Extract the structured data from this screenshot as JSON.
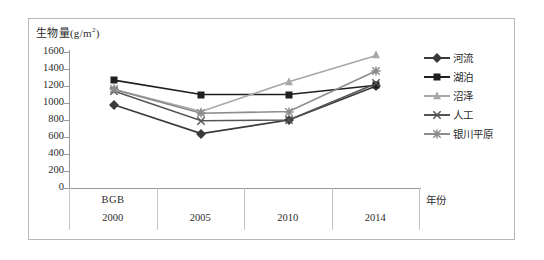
{
  "axes": {
    "y_label": "生物量(g/m",
    "y_label_sup": "2",
    "y_label_tail": ")",
    "x_title": "年份",
    "bgb_note": "BGB",
    "y_ticks": [
      "1600",
      "1400",
      "1200",
      "1000",
      "800",
      "600",
      "400",
      "200",
      "0"
    ]
  },
  "legend": {
    "items": [
      {
        "label": "河流",
        "marker": "diamond",
        "color": "#3a3a3a"
      },
      {
        "label": "湖泊",
        "marker": "square",
        "color": "#1f1f1f"
      },
      {
        "label": "沼泽",
        "marker": "triangle",
        "color": "#a8a8a8"
      },
      {
        "label": "人工",
        "marker": "cross",
        "color": "#555555"
      },
      {
        "label": "银川平原",
        "marker": "star",
        "color": "#8c8c8c"
      }
    ]
  },
  "chart_data": {
    "type": "line",
    "title": "",
    "xlabel": "年份",
    "ylabel": "生物量(g/m2)",
    "categories": [
      "2000",
      "2005",
      "2010",
      "2014"
    ],
    "ylim": [
      0,
      1600
    ],
    "ytick_step": 200,
    "grid": false,
    "legend_position": "right",
    "annotations": [
      "BGB"
    ],
    "series": [
      {
        "name": "河流",
        "marker": "diamond",
        "color": "#3a3a3a",
        "values": [
          980,
          640,
          800,
          1200
        ]
      },
      {
        "name": "湖泊",
        "marker": "square",
        "color": "#1f1f1f",
        "values": [
          1270,
          1100,
          1100,
          1210
        ]
      },
      {
        "name": "沼泽",
        "marker": "triangle",
        "color": "#a8a8a8",
        "values": [
          1160,
          900,
          1250,
          1560
        ]
      },
      {
        "name": "人工",
        "marker": "cross",
        "color": "#555555",
        "values": [
          1140,
          790,
          800,
          1230
        ]
      },
      {
        "name": "银川平原",
        "marker": "star",
        "color": "#8c8c8c",
        "values": [
          1160,
          880,
          900,
          1380
        ]
      }
    ]
  }
}
